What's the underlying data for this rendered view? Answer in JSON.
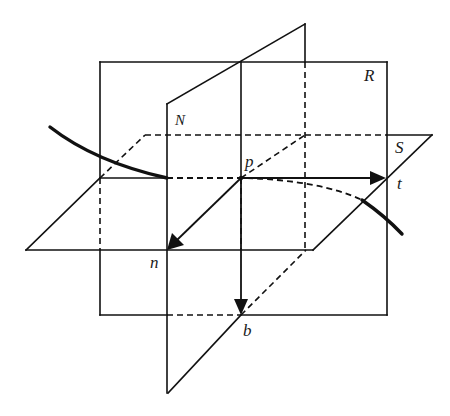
{
  "figure": {
    "labels": {
      "plane_R": "R",
      "plane_N": "N",
      "plane_S": "S",
      "point_p": "p",
      "vector_t": "t",
      "vector_n": "n",
      "vector_b": "b"
    },
    "planes": [
      {
        "name": "R",
        "role": "rectifying plane (vertical rectangle, front view)"
      },
      {
        "name": "N",
        "role": "normal plane (vertical, receding obliquely)"
      },
      {
        "name": "S",
        "role": "osculating plane (horizontal parallelogram)"
      }
    ],
    "vectors": [
      {
        "name": "t",
        "from": "p",
        "direction": "right"
      },
      {
        "name": "n",
        "from": "p",
        "direction": "down-left (toward viewer)"
      },
      {
        "name": "b",
        "from": "p",
        "direction": "down"
      }
    ],
    "colors": {
      "stroke": "#111111",
      "background": "#ffffff"
    }
  }
}
